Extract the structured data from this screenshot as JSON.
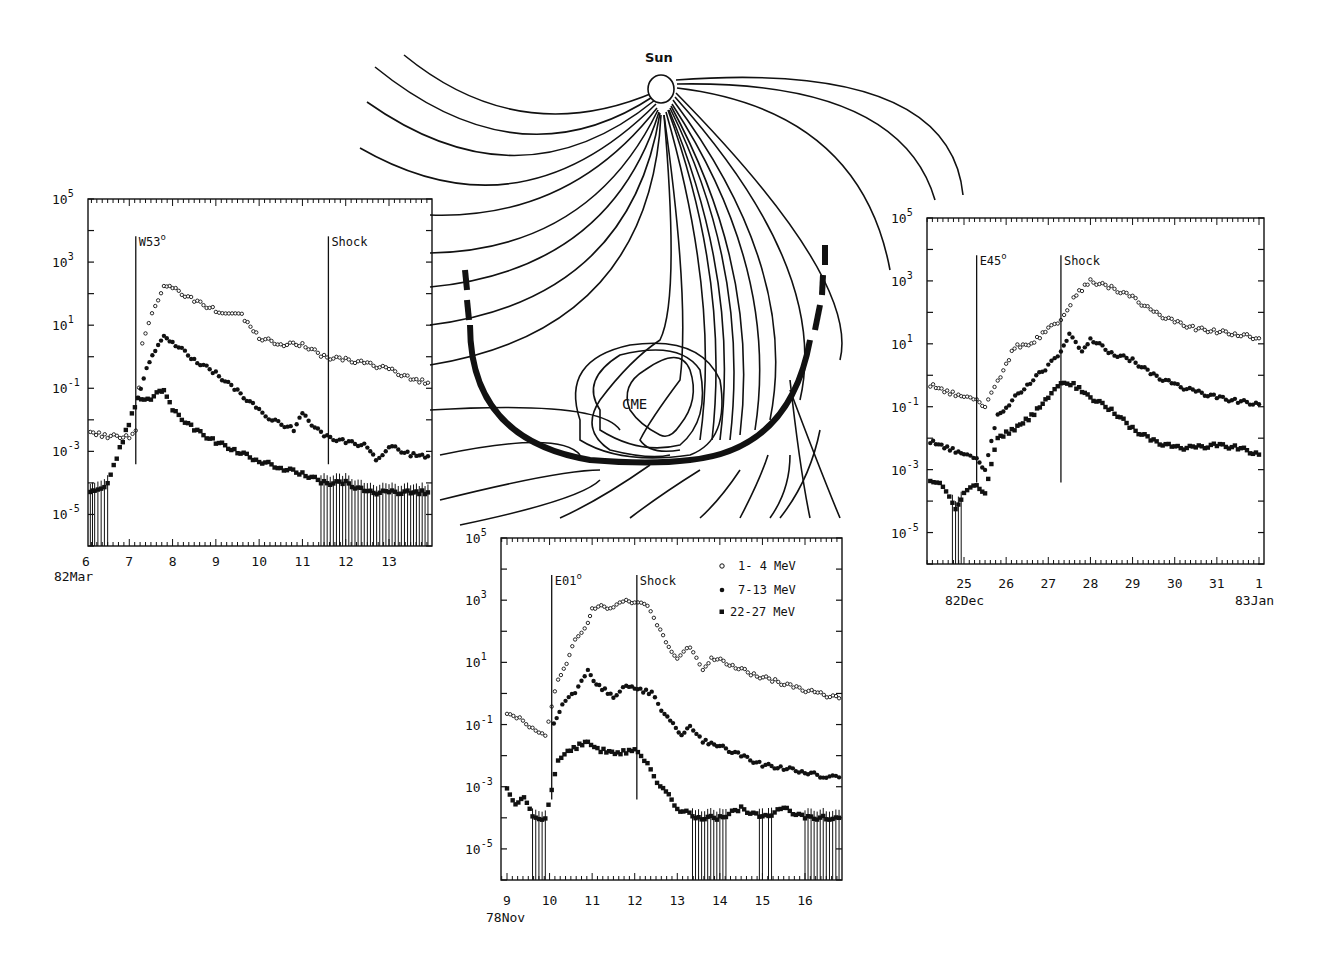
{
  "figure": {
    "diagram": {
      "sun_label": "Sun",
      "cme_label": "CME"
    },
    "legend": [
      {
        "marker": "open-circle",
        "label": "1- 4 MeV"
      },
      {
        "marker": "filled-circle",
        "label": "7-13 MeV"
      },
      {
        "marker": "filled-square",
        "label": "22-27 MeV"
      }
    ],
    "y_tick_labels": [
      "10^5",
      "10^3",
      "10^1",
      "10^-1",
      "10^-3",
      "10^-5"
    ]
  },
  "chart_data": [
    {
      "id": "left",
      "type": "scatter",
      "title": "",
      "xlabel": "82Mar",
      "ylabel": "",
      "yscale": "log",
      "ylim": [
        1e-06,
        100000.0
      ],
      "x_ticks": [
        "6",
        "7",
        "8",
        "9",
        "10",
        "11",
        "12",
        "13"
      ],
      "x_range": [
        6,
        13.95
      ],
      "y_ticks": [
        "10^5",
        "10^3",
        "10^1",
        "10^-1",
        "10^-3",
        "10^-5"
      ],
      "grid": false,
      "annotations": [
        {
          "label": "W53°",
          "x": 7.15,
          "type": "vertical-line"
        },
        {
          "label": "Shock",
          "x": 11.6,
          "type": "vertical-line"
        }
      ],
      "series": [
        {
          "name": "1- 4 MeV",
          "marker": "open-circle",
          "x": [
            6.1,
            6.5,
            7.0,
            7.15,
            7.3,
            7.6,
            7.8,
            8.0,
            8.5,
            9.0,
            9.6,
            10.0,
            10.5,
            11.0,
            11.5,
            12.0,
            12.5,
            13.0,
            13.5,
            13.9
          ],
          "values": [
            0.004,
            0.003,
            0.003,
            0.004,
            3,
            40,
            200,
            150,
            60,
            30,
            20,
            4,
            2.5,
            2.5,
            1,
            0.8,
            0.6,
            0.4,
            0.2,
            0.15
          ]
        },
        {
          "name": "7-13 MeV",
          "marker": "filled-circle",
          "x": [
            7.2,
            7.4,
            7.6,
            7.8,
            8.0,
            8.5,
            9.0,
            9.5,
            10.0,
            10.3,
            10.8,
            11.0,
            11.5,
            12.0,
            12.5,
            12.7,
            13.0,
            13.5,
            13.9
          ],
          "values": [
            0.05,
            0.5,
            1.5,
            4,
            3,
            0.8,
            0.3,
            0.08,
            0.02,
            0.01,
            0.005,
            0.015,
            0.003,
            0.002,
            0.0015,
            0.0005,
            0.0015,
            0.0008,
            0.0007
          ]
        },
        {
          "name": "22-27 MeV",
          "marker": "filled-square",
          "x": [
            6.1,
            6.2,
            6.5,
            7.2,
            7.5,
            7.7,
            7.8,
            8.0,
            8.5,
            9.0,
            9.5,
            10.0,
            10.5,
            11.0,
            11.5,
            12.0,
            12.5,
            13.0,
            13.5,
            13.9
          ],
          "values": [
            5e-05,
            5e-05,
            0.0001,
            0.05,
            0.05,
            0.08,
            0.1,
            0.02,
            0.005,
            0.002,
            0.001,
            0.0005,
            0.0003,
            0.0002,
            0.0001,
            0.0001,
            5e-05,
            5e-05,
            5e-05,
            5e-05
          ]
        }
      ]
    },
    {
      "id": "bottom",
      "type": "scatter",
      "title": "",
      "xlabel": "78Nov",
      "ylabel": "",
      "yscale": "log",
      "ylim": [
        1e-06,
        100000.0
      ],
      "x_ticks": [
        "9",
        "10",
        "11",
        "12",
        "13",
        "14",
        "15",
        "16"
      ],
      "x_range": [
        8.95,
        16.85
      ],
      "y_ticks": [
        "10^5",
        "10^3",
        "10^1",
        "10^-1",
        "10^-3",
        "10^-5"
      ],
      "grid": false,
      "legend": [
        "1- 4 MeV",
        "7-13 MeV",
        "22-27 MeV"
      ],
      "legend_position": "upper right",
      "annotations": [
        {
          "label": "E01°",
          "x": 10.05,
          "type": "vertical-line"
        },
        {
          "label": "Shock",
          "x": 12.05,
          "type": "vertical-line"
        }
      ],
      "series": [
        {
          "name": "1- 4 MeV",
          "marker": "open-circle",
          "x": [
            9.0,
            9.3,
            9.6,
            9.9,
            10.2,
            10.4,
            10.6,
            10.9,
            11.0,
            11.5,
            11.8,
            12.0,
            12.3,
            12.6,
            12.8,
            13.0,
            13.3,
            13.6,
            13.8,
            14.3,
            14.8,
            15.3,
            15.8,
            16.3,
            16.8
          ],
          "values": [
            0.2,
            0.15,
            0.08,
            0.05,
            3,
            10,
            50,
            200,
            600,
            600,
            900,
            900,
            600,
            100,
            30,
            15,
            30,
            5,
            15,
            8,
            4,
            2.5,
            1.5,
            1,
            0.7
          ]
        },
        {
          "name": "7-13 MeV",
          "marker": "filled-circle",
          "x": [
            10.1,
            10.3,
            10.6,
            10.9,
            11.1,
            11.5,
            11.8,
            12.0,
            12.4,
            12.7,
            12.9,
            13.1,
            13.3,
            13.6,
            14.0,
            14.5,
            15.0,
            15.5,
            16.0,
            16.5,
            16.8
          ],
          "values": [
            0.1,
            0.5,
            1,
            5,
            2,
            0.8,
            2,
            1.5,
            1,
            0.2,
            0.1,
            0.05,
            0.1,
            0.03,
            0.02,
            0.01,
            0.005,
            0.004,
            0.003,
            0.002,
            0.002
          ]
        },
        {
          "name": "22-27 MeV",
          "marker": "filled-square",
          "x": [
            9.0,
            9.2,
            9.4,
            9.6,
            9.9,
            10.2,
            10.5,
            10.9,
            11.2,
            11.6,
            12.0,
            12.3,
            12.6,
            12.8,
            13.0,
            13.5,
            14.0,
            14.5,
            15.0,
            15.5,
            16.0,
            16.5,
            16.8
          ],
          "values": [
            0.0008,
            0.0003,
            0.0005,
            0.0001,
            0.0001,
            0.008,
            0.015,
            0.03,
            0.015,
            0.012,
            0.015,
            0.005,
            0.001,
            0.0005,
            0.0002,
            0.0001,
            0.0001,
            0.0002,
            0.0001,
            0.0002,
            0.0001,
            0.0001,
            0.0001
          ]
        }
      ]
    },
    {
      "id": "right",
      "type": "scatter",
      "title": "",
      "xlabel": "82Dec",
      "xlabel_end": "83Jan",
      "ylabel": "",
      "yscale": "log",
      "ylim": [
        1e-06,
        100000.0
      ],
      "x_ticks": [
        "25",
        "26",
        "27",
        "28",
        "29",
        "30",
        "31",
        "1"
      ],
      "x_range": [
        24.2,
        32.05
      ],
      "y_ticks": [
        "10^5",
        "10^3",
        "10^1",
        "10^-1",
        "10^-3",
        "10^-5"
      ],
      "grid": false,
      "annotations": [
        {
          "label": "E45°",
          "x": 25.3,
          "type": "vertical-line"
        },
        {
          "label": "Shock",
          "x": 27.3,
          "type": "vertical-line"
        }
      ],
      "series": [
        {
          "name": "1- 4 MeV",
          "marker": "open-circle",
          "x": [
            24.2,
            24.6,
            25.0,
            25.3,
            25.5,
            25.8,
            26.2,
            26.6,
            27.0,
            27.3,
            27.6,
            28.0,
            28.5,
            29.0,
            29.5,
            30.0,
            30.5,
            31.0,
            31.5,
            32.0
          ],
          "values": [
            0.5,
            0.3,
            0.2,
            0.15,
            0.1,
            0.6,
            8,
            10,
            30,
            50,
            300,
            1000,
            600,
            300,
            100,
            50,
            30,
            25,
            20,
            15
          ]
        },
        {
          "name": "7-13 MeV",
          "marker": "filled-circle",
          "x": [
            24.2,
            24.6,
            25.0,
            25.3,
            25.5,
            25.8,
            26.0,
            26.5,
            27.0,
            27.3,
            27.5,
            27.8,
            28.0,
            28.5,
            29.0,
            29.5,
            30.0,
            30.5,
            31.0,
            31.5,
            32.0
          ],
          "values": [
            0.008,
            0.005,
            0.003,
            0.002,
            0.001,
            0.05,
            0.1,
            0.5,
            2,
            5,
            20,
            5,
            15,
            5,
            3,
            1,
            0.5,
            0.3,
            0.2,
            0.15,
            0.12
          ]
        },
        {
          "name": "22-27 MeV",
          "marker": "filled-square",
          "x": [
            24.2,
            24.5,
            24.8,
            25.0,
            25.3,
            25.5,
            25.8,
            26.2,
            26.6,
            27.0,
            27.3,
            27.6,
            28.0,
            28.5,
            29.0,
            29.5,
            30.0,
            30.5,
            31.0,
            31.5,
            32.0
          ],
          "values": [
            0.0005,
            0.0003,
            5e-05,
            0.0002,
            0.0003,
            0.0002,
            0.01,
            0.02,
            0.05,
            0.2,
            0.5,
            0.5,
            0.2,
            0.08,
            0.02,
            0.008,
            0.005,
            0.005,
            0.006,
            0.005,
            0.003
          ]
        }
      ]
    }
  ]
}
